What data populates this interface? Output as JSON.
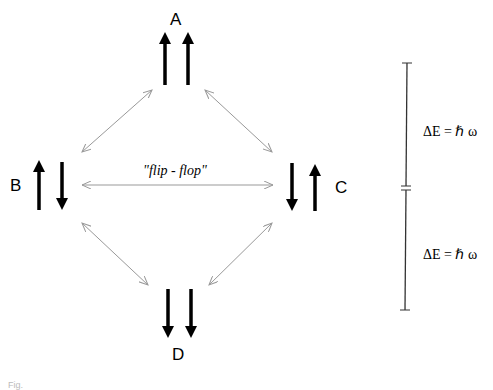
{
  "diagram": {
    "states": [
      {
        "id": "A",
        "label": "A",
        "spins": [
          "up",
          "up"
        ]
      },
      {
        "id": "B",
        "label": "B",
        "spins": [
          "up",
          "down"
        ]
      },
      {
        "id": "C",
        "label": "C",
        "spins": [
          "down",
          "up"
        ]
      },
      {
        "id": "D",
        "label": "D",
        "spins": [
          "down",
          "down"
        ]
      }
    ],
    "transitions": [
      {
        "from": "A",
        "to": "B"
      },
      {
        "from": "A",
        "to": "C"
      },
      {
        "from": "B",
        "to": "C",
        "label": "\"flip - flop\""
      },
      {
        "from": "B",
        "to": "D"
      },
      {
        "from": "C",
        "to": "D"
      }
    ],
    "flip_flop_label": "\"flip - flop\"",
    "energy_levels": {
      "upper_gap": "ΔE = ℏ ω",
      "lower_gap": "ΔE = ℏ ω"
    },
    "colors": {
      "spin_arrow": "#000000",
      "transition_arrow": "#999999",
      "energy_scale": "#333333"
    }
  },
  "caption": "Fig."
}
